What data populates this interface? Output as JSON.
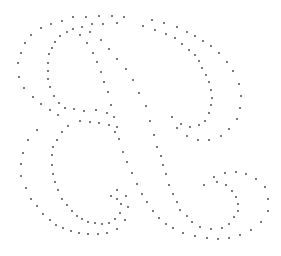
{
  "image": {
    "subject": "dotted outline of a script letter R",
    "width": 281,
    "height": 256,
    "background": "#ffffff",
    "dot_color": "#3a3a3a",
    "dot_radius": 0.9
  },
  "dots": [
    [
      73,
      17
    ],
    [
      86,
      17
    ],
    [
      99,
      16
    ],
    [
      112,
      16
    ],
    [
      124,
      17
    ],
    [
      62,
      21
    ],
    [
      51,
      24
    ],
    [
      41,
      28
    ],
    [
      31,
      35
    ],
    [
      25,
      43
    ],
    [
      21,
      53
    ],
    [
      18,
      63
    ],
    [
      19,
      77
    ],
    [
      24,
      88
    ],
    [
      33,
      97
    ],
    [
      41,
      104
    ],
    [
      50,
      110
    ],
    [
      58,
      115
    ],
    [
      68,
      126
    ],
    [
      73,
      29
    ],
    [
      82,
      27
    ],
    [
      92,
      24
    ],
    [
      103,
      24
    ],
    [
      117,
      23
    ],
    [
      67,
      32
    ],
    [
      60,
      36
    ],
    [
      55,
      42
    ],
    [
      52,
      48
    ],
    [
      49,
      54
    ],
    [
      48,
      63
    ],
    [
      48,
      71
    ],
    [
      48,
      79
    ],
    [
      50,
      87
    ],
    [
      54,
      96
    ],
    [
      59,
      103
    ],
    [
      65,
      108
    ],
    [
      74,
      109
    ],
    [
      84,
      111
    ],
    [
      96,
      110
    ],
    [
      111,
      105
    ],
    [
      80,
      35
    ],
    [
      90,
      32
    ],
    [
      87,
      43
    ],
    [
      93,
      53
    ],
    [
      97,
      62
    ],
    [
      101,
      72
    ],
    [
      104,
      82
    ],
    [
      108,
      92
    ],
    [
      101,
      40
    ],
    [
      109,
      49
    ],
    [
      117,
      59
    ],
    [
      126,
      69
    ],
    [
      133,
      80
    ],
    [
      139,
      93
    ],
    [
      107,
      113
    ],
    [
      114,
      117
    ],
    [
      80,
      121
    ],
    [
      90,
      122
    ],
    [
      99,
      123
    ],
    [
      109,
      125
    ],
    [
      117,
      127
    ],
    [
      152,
      20
    ],
    [
      143,
      26
    ],
    [
      155,
      30
    ],
    [
      164,
      23
    ],
    [
      166,
      34
    ],
    [
      177,
      27
    ],
    [
      175,
      38
    ],
    [
      187,
      32
    ],
    [
      182,
      44
    ],
    [
      195,
      36
    ],
    [
      189,
      50
    ],
    [
      203,
      41
    ],
    [
      195,
      55
    ],
    [
      211,
      46
    ],
    [
      199,
      61
    ],
    [
      219,
      53
    ],
    [
      202,
      68
    ],
    [
      227,
      62
    ],
    [
      206,
      75
    ],
    [
      233,
      71
    ],
    [
      209,
      82
    ],
    [
      239,
      84
    ],
    [
      211,
      90
    ],
    [
      241,
      96
    ],
    [
      212,
      98
    ],
    [
      240,
      108
    ],
    [
      211,
      105
    ],
    [
      237,
      119
    ],
    [
      209,
      113
    ],
    [
      205,
      121
    ],
    [
      199,
      125
    ],
    [
      190,
      127
    ],
    [
      181,
      124
    ],
    [
      172,
      117
    ],
    [
      146,
      106
    ],
    [
      150,
      121
    ],
    [
      177,
      128
    ],
    [
      37,
      130
    ],
    [
      62,
      132
    ],
    [
      28,
      140
    ],
    [
      57,
      140
    ],
    [
      23,
      153
    ],
    [
      53,
      147
    ],
    [
      21,
      164
    ],
    [
      52,
      155
    ],
    [
      21,
      176
    ],
    [
      52,
      165
    ],
    [
      26,
      188
    ],
    [
      53,
      174
    ],
    [
      31,
      199
    ],
    [
      55,
      182
    ],
    [
      37,
      206
    ],
    [
      58,
      190
    ],
    [
      43,
      214
    ],
    [
      62,
      199
    ],
    [
      50,
      220
    ],
    [
      67,
      205
    ],
    [
      56,
      225
    ],
    [
      72,
      211
    ],
    [
      63,
      228
    ],
    [
      77,
      216
    ],
    [
      71,
      231
    ],
    [
      82,
      219
    ],
    [
      79,
      233
    ],
    [
      88,
      222
    ],
    [
      88,
      234
    ],
    [
      95,
      223
    ],
    [
      98,
      234
    ],
    [
      102,
      224
    ],
    [
      107,
      233
    ],
    [
      109,
      223
    ],
    [
      117,
      229
    ],
    [
      115,
      219
    ],
    [
      125,
      220
    ],
    [
      120,
      213
    ],
    [
      128,
      207
    ],
    [
      121,
      204
    ],
    [
      126,
      196
    ],
    [
      117,
      199
    ],
    [
      111,
      196
    ],
    [
      117,
      190
    ],
    [
      137,
      184
    ],
    [
      132,
      173
    ],
    [
      127,
      162
    ],
    [
      123,
      152
    ],
    [
      119,
      139
    ],
    [
      115,
      132
    ],
    [
      187,
      136
    ],
    [
      198,
      140
    ],
    [
      209,
      140
    ],
    [
      221,
      136
    ],
    [
      229,
      129
    ],
    [
      154,
      135
    ],
    [
      157,
      147
    ],
    [
      161,
      156
    ],
    [
      163,
      165
    ],
    [
      166,
      174
    ],
    [
      169,
      185
    ],
    [
      173,
      194
    ],
    [
      177,
      202
    ],
    [
      180,
      210
    ],
    [
      187,
      216
    ],
    [
      192,
      222
    ],
    [
      200,
      227
    ],
    [
      211,
      229
    ],
    [
      222,
      228
    ],
    [
      229,
      224
    ],
    [
      234,
      217
    ],
    [
      238,
      211
    ],
    [
      238,
      204
    ],
    [
      236,
      197
    ],
    [
      232,
      191
    ],
    [
      226,
      185
    ],
    [
      217,
      182
    ],
    [
      214,
      177
    ],
    [
      225,
      173
    ],
    [
      236,
      172
    ],
    [
      246,
      174
    ],
    [
      256,
      179
    ],
    [
      265,
      187
    ],
    [
      268,
      199
    ],
    [
      268,
      211
    ],
    [
      261,
      222
    ],
    [
      251,
      230
    ],
    [
      240,
      235
    ],
    [
      229,
      238
    ],
    [
      218,
      239
    ],
    [
      207,
      238
    ],
    [
      195,
      236
    ],
    [
      183,
      233
    ],
    [
      173,
      228
    ],
    [
      166,
      224
    ],
    [
      159,
      218
    ],
    [
      153,
      211
    ],
    [
      147,
      202
    ],
    [
      142,
      194
    ],
    [
      204,
      185
    ]
  ]
}
